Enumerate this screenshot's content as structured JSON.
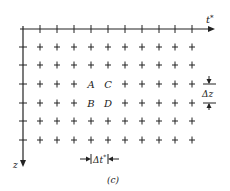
{
  "diagram": {
    "caption": "(c)",
    "axes": {
      "horizontal_label": "t",
      "horizontal_superscript": "*",
      "vertical_label": "z"
    },
    "grid": {
      "columns_x": [
        40,
        57,
        74,
        91,
        108,
        125,
        142,
        159,
        175,
        192
      ],
      "rows_y": [
        47,
        65,
        84,
        103,
        121,
        140
      ]
    },
    "points": [
      {
        "label": "A",
        "col": 3,
        "row": 2
      },
      {
        "label": "C",
        "col": 4,
        "row": 2
      },
      {
        "label": "B",
        "col": 3,
        "row": 3
      },
      {
        "label": "D",
        "col": 4,
        "row": 3
      }
    ],
    "spacing": {
      "dz_label": "Δz",
      "dt_label": "Δt",
      "dt_superscript": "*"
    },
    "colors": {
      "ink": "#222222",
      "background": "#ffffff"
    }
  }
}
